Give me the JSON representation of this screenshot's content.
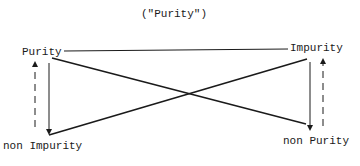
{
  "title": "(\"Purity\")",
  "nodes": {
    "top_left": "Purity",
    "top_right": "Impurity",
    "bottom_left": "non Impurity",
    "bottom_right": "non Purity"
  },
  "colors": {
    "ink": "#1a1a1a",
    "background": "#ffffff"
  }
}
